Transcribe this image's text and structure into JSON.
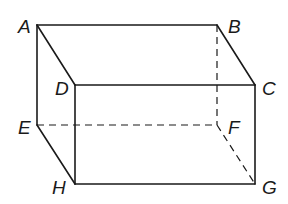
{
  "diagram": {
    "type": "rectangular-prism",
    "vertices": {
      "A": {
        "label": "A",
        "x": 37,
        "y": 25,
        "lx": 18,
        "ly": 33
      },
      "B": {
        "label": "B",
        "x": 217,
        "y": 25,
        "lx": 228,
        "ly": 33
      },
      "C": {
        "label": "C",
        "x": 255,
        "y": 85,
        "lx": 262,
        "ly": 95
      },
      "D": {
        "label": "D",
        "x": 75,
        "y": 85,
        "lx": 55,
        "ly": 95
      },
      "E": {
        "label": "E",
        "x": 37,
        "y": 125,
        "lx": 18,
        "ly": 134
      },
      "F": {
        "label": "F",
        "x": 217,
        "y": 125,
        "lx": 228,
        "ly": 134
      },
      "G": {
        "label": "G",
        "x": 255,
        "y": 184,
        "lx": 262,
        "ly": 194
      },
      "H": {
        "label": "H",
        "x": 75,
        "y": 184,
        "lx": 52,
        "ly": 194
      }
    },
    "solid_edges": [
      [
        "A",
        "B"
      ],
      [
        "A",
        "D"
      ],
      [
        "B",
        "C"
      ],
      [
        "D",
        "C"
      ],
      [
        "A",
        "E"
      ],
      [
        "D",
        "H"
      ],
      [
        "C",
        "G"
      ],
      [
        "E",
        "H"
      ],
      [
        "H",
        "G"
      ]
    ],
    "hidden_edges": [
      [
        "B",
        "F"
      ],
      [
        "E",
        "F"
      ],
      [
        "F",
        "G"
      ]
    ],
    "stroke_color": "#1a1a1a"
  }
}
